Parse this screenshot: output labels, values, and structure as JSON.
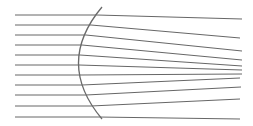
{
  "diagram": {
    "width": 253,
    "height": 126,
    "background": "#ffffff",
    "ray_color": "#555555",
    "lens_color": "#6a6a6a",
    "ray_width": 0.9,
    "lens_width": 1.3,
    "lens": {
      "top": [
        102,
        7
      ],
      "control": [
        55,
        63
      ],
      "bottom": [
        102,
        119
      ]
    },
    "rays": [
      {
        "y": 15,
        "hit_x": 97,
        "end": [
          242,
          19
        ]
      },
      {
        "y": 25,
        "hit_x": 91,
        "end": [
          240,
          38
        ]
      },
      {
        "y": 35,
        "hit_x": 86,
        "end": [
          242,
          51
        ]
      },
      {
        "y": 45,
        "hit_x": 82,
        "end": [
          242,
          60
        ]
      },
      {
        "y": 55,
        "hit_x": 80,
        "end": [
          242,
          66
        ]
      },
      {
        "y": 65,
        "hit_x": 79,
        "end": [
          242,
          70
        ]
      },
      {
        "y": 75,
        "hit_x": 80,
        "end": [
          242,
          74
        ]
      },
      {
        "y": 85,
        "hit_x": 82,
        "end": [
          240,
          78
        ]
      },
      {
        "y": 95,
        "hit_x": 86,
        "end": [
          241,
          87
        ]
      },
      {
        "y": 106,
        "hit_x": 91,
        "end": [
          240,
          99
        ]
      },
      {
        "y": 117,
        "hit_x": 98,
        "end": [
          240,
          119
        ]
      }
    ],
    "ray_start_x": 15
  }
}
